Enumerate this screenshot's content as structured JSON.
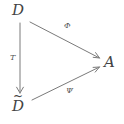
{
  "diagram": {
    "type": "commutative-triangle",
    "background_color": "#ffffff",
    "stroke_color": "#7a7a7a",
    "text_color": "#434343",
    "nodes": [
      {
        "id": "D",
        "label": "D",
        "accent": "",
        "x": 20,
        "y": 14
      },
      {
        "id": "Dtilde",
        "label": "D",
        "accent": "~",
        "x": 20,
        "y": 108
      },
      {
        "id": "A",
        "label": "A",
        "accent": "",
        "x": 110,
        "y": 63
      }
    ],
    "arrows": [
      {
        "id": "phi",
        "from": "D",
        "to": "A",
        "label": "Φ",
        "x1": 30,
        "y1": 22,
        "x2": 100,
        "y2": 58
      },
      {
        "id": "psi",
        "from": "Dtilde",
        "to": "A",
        "label": "Ψ",
        "x1": 32,
        "y1": 100,
        "x2": 100,
        "y2": 68
      },
      {
        "id": "T",
        "from": "D",
        "to": "Dtilde",
        "label": "T",
        "x1": 20,
        "y1": 23,
        "x2": 20,
        "y2": 93
      }
    ]
  }
}
